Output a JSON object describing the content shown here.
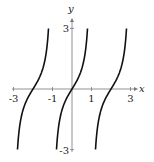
{
  "chart_data": {
    "type": "line",
    "title": "",
    "function": "y = tan(pi*x/2)",
    "xlabel": "x",
    "ylabel": "y",
    "xlim": [
      -3.3,
      3.5
    ],
    "ylim": [
      -3.1,
      3.1
    ],
    "x_ticks": [
      -3,
      -1,
      1,
      3
    ],
    "x_tick_labels": [
      "-3",
      "-1",
      "1",
      "3"
    ],
    "y_ticks": [
      3,
      -3
    ],
    "y_tick_labels": [
      "3",
      "-3"
    ],
    "grid": false,
    "legend": null,
    "asymptotes_x": [
      -3,
      -1,
      1,
      3
    ],
    "series": [
      {
        "name": "branch-left",
        "x_range": [
          -2.795,
          -1.205
        ],
        "center": -2
      },
      {
        "name": "branch-middle",
        "x_range": [
          -0.795,
          0.795
        ],
        "center": 0
      },
      {
        "name": "branch-right",
        "x_range": [
          1.205,
          2.795
        ],
        "center": 2
      }
    ],
    "color": "#111111"
  }
}
